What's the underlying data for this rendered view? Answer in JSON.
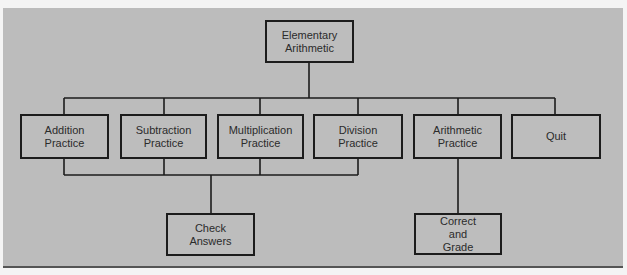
{
  "diagram": {
    "type": "hierarchy-chart",
    "colors": {
      "background": "#bcbcbc",
      "line": "#1c1c1c",
      "text": "#2b2b2b"
    },
    "root": {
      "label": "Elementary\nArithmetic"
    },
    "level1": [
      {
        "label": "Addition\nPractice"
      },
      {
        "label": "Subtraction\nPractice"
      },
      {
        "label": "Multiplication\nPractice"
      },
      {
        "label": "Division\nPractice"
      },
      {
        "label": "Arithmetic\nPractice"
      },
      {
        "label": "Quit"
      }
    ],
    "level2": [
      {
        "label": "Check\nAnswers",
        "parents": [
          "Addition Practice",
          "Subtraction Practice",
          "Multiplication Practice",
          "Division Practice"
        ]
      },
      {
        "label": "Correct\nand\nGrade",
        "parents": [
          "Arithmetic Practice"
        ]
      }
    ]
  }
}
